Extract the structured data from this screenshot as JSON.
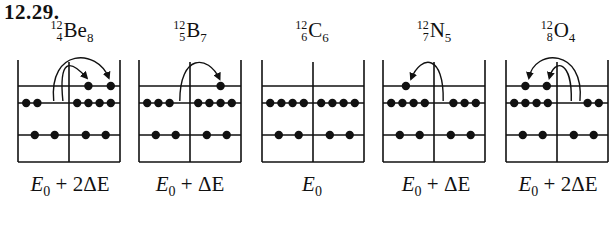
{
  "problem_number": "12.29.",
  "panels": [
    {
      "mass": "12",
      "Z": "4",
      "symbol": "Be",
      "N": "8",
      "energy_label": "E0 + 2ΔE",
      "energy_base": "E",
      "energy_sub": "0",
      "energy_rest": " + 2ΔE",
      "left_occupancy": [
        0,
        2,
        2
      ],
      "right_occupancy": [
        2,
        4,
        2
      ],
      "transitions": 2,
      "direction": "left-to-right"
    },
    {
      "mass": "12",
      "Z": "5",
      "symbol": "B",
      "N": "7",
      "energy_label": "E0 + ΔE",
      "energy_base": "E",
      "energy_sub": "0",
      "energy_rest": " + ΔE",
      "left_occupancy": [
        0,
        3,
        2
      ],
      "right_occupancy": [
        1,
        4,
        2
      ],
      "transitions": 1,
      "direction": "left-to-right"
    },
    {
      "mass": "12",
      "Z": "6",
      "symbol": "C",
      "N": "6",
      "energy_label": "E0",
      "energy_base": "E",
      "energy_sub": "0",
      "energy_rest": "",
      "left_occupancy": [
        0,
        4,
        2
      ],
      "right_occupancy": [
        0,
        4,
        2
      ],
      "transitions": 0,
      "direction": "none"
    },
    {
      "mass": "12",
      "Z": "7",
      "symbol": "N",
      "N": "5",
      "energy_label": "E0 + ΔE",
      "energy_base": "E",
      "energy_sub": "0",
      "energy_rest": " + ΔE",
      "left_occupancy": [
        1,
        4,
        2
      ],
      "right_occupancy": [
        0,
        3,
        2
      ],
      "transitions": 1,
      "direction": "right-to-left"
    },
    {
      "mass": "12",
      "Z": "8",
      "symbol": "O",
      "N": "4",
      "energy_label": "E0 + 2ΔE",
      "energy_base": "E",
      "energy_sub": "0",
      "energy_rest": " + 2ΔE",
      "left_occupancy": [
        2,
        4,
        2
      ],
      "right_occupancy": [
        0,
        2,
        2
      ],
      "transitions": 2,
      "direction": "right-to-left"
    }
  ],
  "colors": {
    "ink": "#111111",
    "background": "#ffffff"
  }
}
